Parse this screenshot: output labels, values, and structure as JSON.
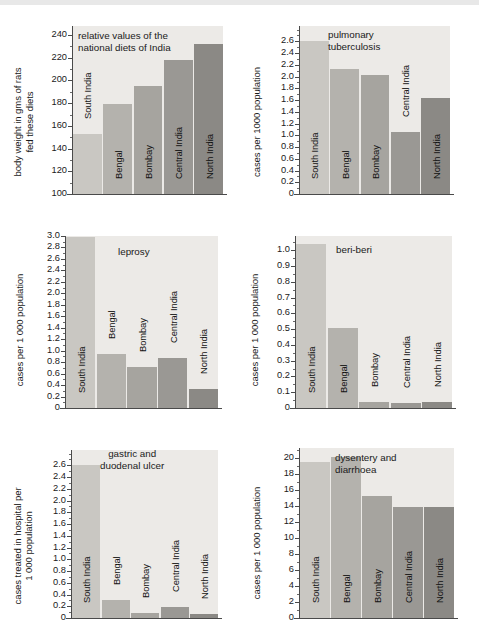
{
  "page": {
    "background_color": "#ffffff",
    "plot_background_color": "#eceae7",
    "axis_color": "#4a4a4a",
    "bar_palette": [
      "#c9c7c2",
      "#b4b2ad",
      "#a6a49f",
      "#9a9894",
      "#8b8985"
    ],
    "categories": [
      "South India",
      "Bengal",
      "Bombay",
      "Central India",
      "North India"
    ]
  },
  "chart_data": [
    {
      "id": "diets",
      "type": "bar",
      "title": "relative values of the\nnational diets of India",
      "ylabel": "body weight in gms of rats\nfed these diets",
      "xlabel": "",
      "categories": [
        "South India",
        "Bengal",
        "Bombay",
        "Central India",
        "North India"
      ],
      "values": [
        153,
        179,
        195,
        218,
        232
      ],
      "ylim": [
        100,
        248
      ],
      "yticks": [
        100,
        120,
        140,
        160,
        180,
        200,
        220,
        240
      ],
      "ytick_labels": [
        "100",
        "120",
        "140",
        "160",
        "180",
        "200",
        "220",
        "240"
      ],
      "minor_tick_step": 10,
      "grid": false,
      "legend": "none"
    },
    {
      "id": "tuberculosis",
      "type": "bar",
      "title": "pulmonary\ntuberculosis",
      "ylabel": "cases per 1000 population",
      "xlabel": "",
      "categories": [
        "South India",
        "Bengal",
        "Bombay",
        "Central India",
        "North India"
      ],
      "values": [
        2.6,
        2.12,
        2.02,
        1.05,
        1.64
      ],
      "ylim": [
        0,
        2.86
      ],
      "yticks": [
        0,
        0.2,
        0.4,
        0.6,
        0.8,
        1.0,
        1.2,
        1.4,
        1.6,
        1.8,
        2.0,
        2.2,
        2.4,
        2.6
      ],
      "ytick_labels": [
        "0",
        "0.2",
        "0.4",
        "0.6",
        "0.8",
        "1.0",
        "1.2",
        "1.4",
        "1.6",
        "1.8",
        "2.0",
        "2.2",
        "2.4",
        "2.6"
      ],
      "minor_tick_step": 0.1,
      "grid": false,
      "legend": "none"
    },
    {
      "id": "leprosy",
      "type": "bar",
      "title": "leprosy",
      "ylabel": "cases per 1 000 population",
      "xlabel": "",
      "categories": [
        "South India",
        "Bengal",
        "Bombay",
        "Central India",
        "North India"
      ],
      "values": [
        2.99,
        0.94,
        0.72,
        0.87,
        0.33
      ],
      "ylim": [
        0,
        3.0
      ],
      "yticks": [
        0,
        0.2,
        0.4,
        0.6,
        0.8,
        1.0,
        1.2,
        1.4,
        1.6,
        1.8,
        2.0,
        2.2,
        2.4,
        2.6,
        2.8,
        3.0
      ],
      "ytick_labels": [
        "0",
        "0.2",
        "0.4",
        "0.6",
        "0.8",
        "1.0",
        "1.2",
        "1.4",
        "1.6",
        "1.8",
        "2.0",
        "2.2",
        "2.4",
        "2.6",
        "2.8",
        "3.0"
      ],
      "minor_tick_step": 0.1,
      "grid": false,
      "legend": "none"
    },
    {
      "id": "beriberi",
      "type": "bar",
      "title": "beri-beri",
      "ylabel": "cases per 1 000 population",
      "xlabel": "",
      "categories": [
        "South India",
        "Bengal",
        "Bombay",
        "Central India",
        "North India"
      ],
      "values": [
        1.04,
        0.505,
        0.035,
        0.03,
        0.035
      ],
      "ylim": [
        0,
        1.09
      ],
      "yticks": [
        0,
        0.1,
        0.2,
        0.3,
        0.4,
        0.5,
        0.6,
        0.7,
        0.8,
        0.9,
        1.0
      ],
      "ytick_labels": [
        "0",
        "0.1",
        "0.2",
        "0.3",
        "0.4",
        "0.5",
        "0.6",
        "0.7",
        "0.8",
        "0.9",
        "1.0"
      ],
      "minor_tick_step": 0.05,
      "grid": false,
      "legend": "none"
    },
    {
      "id": "ulcer",
      "type": "bar",
      "title": "gastric and\nduodenal ulcer",
      "ylabel": "cases treated in hospital per\n1 000 population",
      "xlabel": "",
      "categories": [
        "South India",
        "Bengal",
        "Bombay",
        "Central India",
        "North India"
      ],
      "values": [
        2.6,
        0.3,
        0.08,
        0.19,
        0.06
      ],
      "ylim": [
        0,
        2.86
      ],
      "yticks": [
        0,
        0.2,
        0.4,
        0.6,
        0.8,
        1.0,
        1.2,
        1.4,
        1.6,
        1.8,
        2.0,
        2.2,
        2.4,
        2.6
      ],
      "ytick_labels": [
        "0",
        "0.2",
        "0.4",
        "0.6",
        "0.8",
        "1.0",
        "1.2",
        "1.4",
        "1.6",
        "1.8",
        "2.0",
        "2.2",
        "2.4",
        "2.6"
      ],
      "minor_tick_step": 0.1,
      "grid": false,
      "legend": "none"
    },
    {
      "id": "dysentery",
      "type": "bar",
      "title": "dysentery and\ndiarrhoea",
      "ylabel": "cases per 1 000 population",
      "xlabel": "",
      "categories": [
        "South India",
        "Bengal",
        "Bombay",
        "Central India",
        "North India"
      ],
      "values": [
        19.4,
        20.1,
        15.2,
        13.9,
        13.8
      ],
      "ylim": [
        0,
        21.2
      ],
      "yticks": [
        0,
        2,
        4,
        6,
        8,
        10,
        12,
        14,
        16,
        18,
        20
      ],
      "ytick_labels": [
        "0",
        "2",
        "4",
        "6",
        "8",
        "10",
        "12",
        "14",
        "16",
        "18",
        "20"
      ],
      "minor_tick_step": 1,
      "grid": false,
      "legend": "none"
    }
  ]
}
